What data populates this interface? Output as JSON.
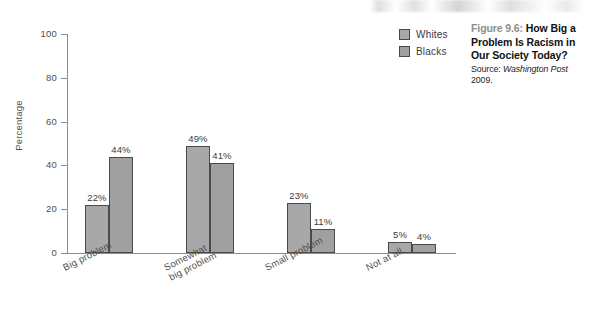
{
  "caption": {
    "figure_number": "Figure 9.6:",
    "title": " How Big a Problem Is Racism in Our Society Today?",
    "source_prefix": "Source: ",
    "source_publication": "Washington Post",
    "source_suffix": " 2009."
  },
  "legend": {
    "items": [
      {
        "label": "Whites",
        "color": "#a8a8a8"
      },
      {
        "label": "Blacks",
        "color": "#a0a0a0"
      }
    ]
  },
  "chart_data": {
    "type": "bar",
    "title": "How Big a Problem Is Racism in Our Society Today?",
    "xlabel": "",
    "ylabel": "Percentage",
    "ylim": [
      0,
      100
    ],
    "yticks": [
      0,
      20,
      40,
      60,
      80,
      100
    ],
    "ytick_labels": [
      "0",
      "20",
      "40",
      "60",
      "80",
      "100"
    ],
    "grid": false,
    "legend_position": "top-right",
    "categories": [
      "Big problem",
      "Somewhat big problem",
      "Small problem",
      "Not at all"
    ],
    "category_label_lines": [
      [
        "Big problem"
      ],
      [
        "Somewhat",
        "big problem"
      ],
      [
        "Small problem"
      ],
      [
        "Not at all"
      ]
    ],
    "series": [
      {
        "name": "Whites",
        "values": [
          22,
          49,
          23,
          5
        ],
        "value_labels": [
          "22%",
          "49%",
          "23%",
          "5%"
        ]
      },
      {
        "name": "Blacks",
        "values": [
          44,
          41,
          11,
          4
        ],
        "value_labels": [
          "44%",
          "41%",
          "11%",
          "4%"
        ]
      }
    ]
  }
}
